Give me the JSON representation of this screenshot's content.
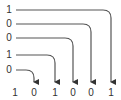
{
  "inputs": [
    {
      "label": "1",
      "y": 10,
      "target_x": 111
    },
    {
      "label": "0",
      "y": 24,
      "target_x": 91
    },
    {
      "label": "0",
      "y": 38,
      "target_x": 73
    },
    {
      "label": "1",
      "y": 55,
      "target_x": 55
    },
    {
      "label": "0",
      "y": 70,
      "target_x": 34
    }
  ],
  "outputs": [
    {
      "label": "1",
      "x": 15
    },
    {
      "label": "0",
      "x": 34
    },
    {
      "label": "1",
      "x": 55
    },
    {
      "label": "0",
      "x": 73
    },
    {
      "label": "0",
      "x": 91
    },
    {
      "label": "1",
      "x": 111
    }
  ],
  "colors": {
    "line": "#444444",
    "text": "#333333"
  }
}
